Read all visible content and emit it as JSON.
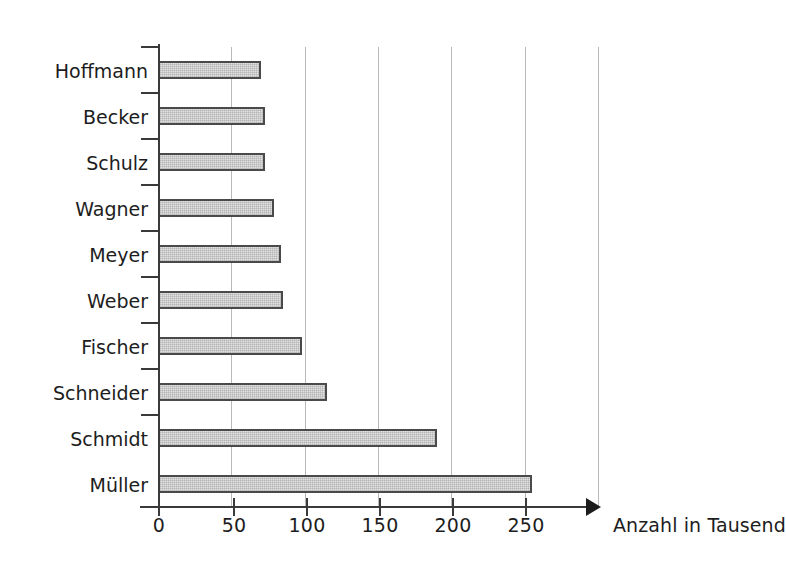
{
  "chart_data": {
    "type": "bar",
    "orientation": "horizontal",
    "title": "",
    "subtitle": "",
    "xlabel": "Anzahl in Tausend",
    "ylabel": "",
    "categories": [
      "Hoffmann",
      "Becker",
      "Schulz",
      "Wagner",
      "Meyer",
      "Weber",
      "Fischer",
      "Schneider",
      "Schmidt",
      "Müller"
    ],
    "values": [
      70,
      73,
      73,
      79,
      84,
      85,
      98,
      115,
      190,
      255
    ],
    "xlim": [
      0,
      300
    ],
    "xticks": [
      0,
      50,
      100,
      150,
      200,
      250
    ],
    "xtick_labels": [
      "0",
      "50",
      "100",
      "150",
      "200",
      "250"
    ],
    "gridlines_x": [
      50,
      100,
      150,
      200,
      250,
      300
    ],
    "grid": true,
    "legend": null,
    "legend_position": "none",
    "bar_fill": "#e2e2e2",
    "bar_border": "#4a4a4a",
    "grid_color": "#b9b9b9",
    "axis_color": "#3a3a3a",
    "text_color": "#1d1d1d",
    "background": "#ffffff",
    "annotations": []
  },
  "axis": {
    "x_title": "Anzahl in Tausend",
    "arrow": "right-arrow-icon"
  }
}
